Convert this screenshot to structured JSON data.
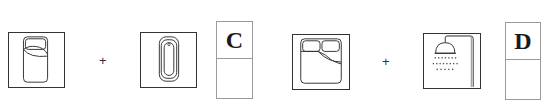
{
  "puzzle": {
    "groups": [
      {
        "id": "C",
        "items": [
          {
            "icon": "single-bed-icon",
            "description": "Single bed, top view"
          },
          {
            "icon": "bathtub-icon",
            "description": "Bathtub, top view"
          }
        ],
        "operator": "+",
        "answer_label": "C",
        "answer_value": ""
      },
      {
        "id": "D",
        "items": [
          {
            "icon": "double-bed-icon",
            "description": "Double bed, top view"
          },
          {
            "icon": "shower-icon",
            "description": "Shower head"
          }
        ],
        "operator": "+",
        "answer_label": "D",
        "answer_value": ""
      }
    ]
  },
  "colors": {
    "icon_stroke": "#333333",
    "answer_border": "#9a9a9a",
    "background": "#ffffff"
  }
}
